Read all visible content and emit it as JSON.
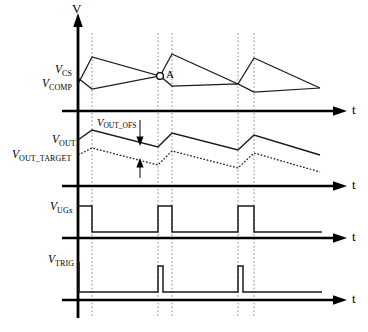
{
  "figure": {
    "type": "timing-waveform-diagram",
    "axes": {
      "vertical_label": "V",
      "time_label": "t"
    },
    "gridlines_x": [
      92,
      158,
      172,
      238,
      254
    ],
    "panels": [
      {
        "id": "panel-cs-comp",
        "baseline_y": 111,
        "signals": [
          {
            "name": "V_CS",
            "label_main": "V",
            "label_sub": "CS",
            "style": "solid"
          },
          {
            "name": "V_COMP",
            "label_main": "V",
            "label_sub": "COMP",
            "style": "solid"
          }
        ],
        "marker": {
          "label": "A",
          "x": 160,
          "y": 76
        }
      },
      {
        "id": "panel-vout",
        "baseline_y": 186,
        "signals": [
          {
            "name": "V_OUT",
            "label_main": "V",
            "label_sub": "OUT",
            "style": "solid"
          },
          {
            "name": "V_OUT_TARGET",
            "label_main": "V",
            "label_sub": "OUT_TARGET",
            "style": "dotted"
          }
        ],
        "annotation": {
          "name": "V_OUT_OFS",
          "label_main": "V",
          "label_sub": "OUT_OFS"
        }
      },
      {
        "id": "panel-ugx",
        "baseline_y": 238,
        "signals": [
          {
            "name": "V_UGx",
            "label_main": "V",
            "label_sub": "UGx",
            "style": "pulse"
          }
        ]
      },
      {
        "id": "panel-trig",
        "baseline_y": 300,
        "signals": [
          {
            "name": "V_TRIG",
            "label_main": "V",
            "label_sub": "TRIG",
            "style": "spike"
          }
        ]
      }
    ]
  },
  "labels": {
    "v_axis": "V",
    "t_axis_1": "t",
    "t_axis_2": "t",
    "t_axis_3": "t",
    "t_axis_4": "t",
    "v_cs_main": "V",
    "v_cs_sub": "CS",
    "v_comp_main": "V",
    "v_comp_sub": "COMP",
    "v_out_main": "V",
    "v_out_sub": "OUT",
    "v_out_target_main": "V",
    "v_out_target_sub": "OUT_TARGET",
    "v_out_ofs_main": "V",
    "v_out_ofs_sub": "OUT_OFS",
    "v_ugx_main": "V",
    "v_ugx_sub": "UGx",
    "v_trig_main": "V",
    "v_trig_sub": "TRIG",
    "marker_a": "A"
  },
  "colors": {
    "background": "#ffffff",
    "trace": "#1a1a1a",
    "axis": "#000000",
    "gridline": "#8a8a8a"
  }
}
